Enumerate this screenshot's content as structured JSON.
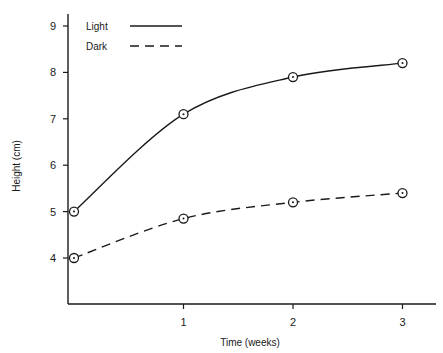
{
  "chart_data": {
    "type": "line",
    "title": "",
    "xlabel": "Time (weeks)",
    "ylabel": "Height (cm)",
    "x": [
      0,
      1,
      2,
      3
    ],
    "x_ticks": [
      1,
      2,
      3
    ],
    "y_ticks": [
      4,
      5,
      6,
      7,
      8,
      9
    ],
    "xlim": [
      0,
      3.3
    ],
    "ylim": [
      3,
      9.5
    ],
    "grid": false,
    "legend_position": "upper-left",
    "series": [
      {
        "name": "Light",
        "values": [
          5.0,
          7.1,
          7.9,
          8.2
        ],
        "line_style": "solid",
        "marker": "circle-dot",
        "color": "#1a1a1a"
      },
      {
        "name": "Dark",
        "values": [
          4.0,
          4.85,
          5.2,
          5.4
        ],
        "line_style": "dashed",
        "marker": "circle-dot",
        "color": "#1a1a1a"
      }
    ]
  }
}
